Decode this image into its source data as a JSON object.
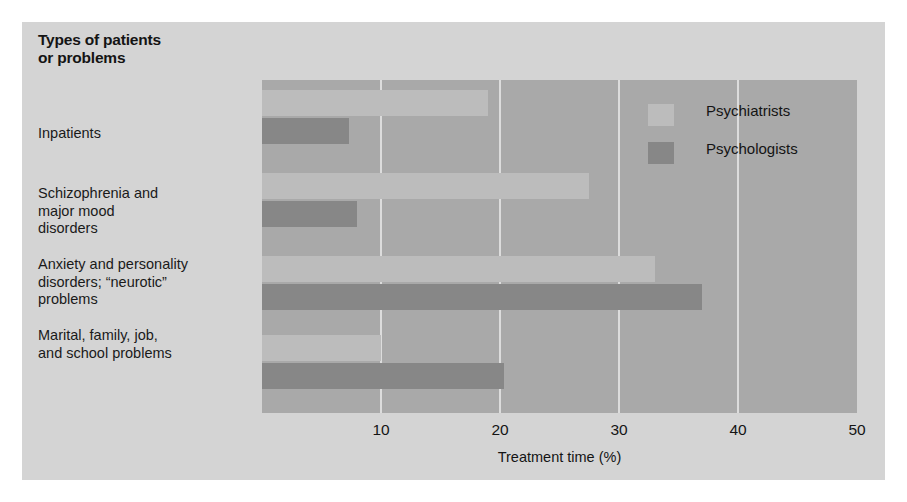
{
  "chart_data": {
    "type": "bar",
    "orientation": "horizontal",
    "xlabel": "Treatment time (%)",
    "ylabel": "",
    "xlim": [
      0,
      50
    ],
    "xticks": [
      0,
      10,
      20,
      30,
      40,
      50
    ],
    "xtick_labels": [
      "",
      "10",
      "20",
      "30",
      "40",
      "50"
    ],
    "grid": "vertical",
    "legend_position": "inside-top-right",
    "categories": [
      "Inpatients",
      "Schizophrenia and major mood disorders",
      "Anxiety and personality disorders; “neurotic” problems",
      "Marital, family, job, and school problems"
    ],
    "category_labels_multiline": [
      [
        "Inpatients"
      ],
      [
        "Schizophrenia and",
        "major mood",
        "disorders"
      ],
      [
        "Anxiety and personality",
        "disorders; “neurotic”",
        "problems"
      ],
      [
        "Marital, family, job,",
        "and school problems"
      ]
    ],
    "series": [
      {
        "name": "Psychiatrists",
        "color": "#bcbcbc",
        "values": [
          19,
          27.5,
          33,
          10
        ]
      },
      {
        "name": "Psychologists",
        "color": "#878787",
        "values": [
          7.3,
          8,
          37,
          20.3
        ]
      }
    ],
    "plot_background": "#a9a9a9",
    "figure_background": "#d4d4d4",
    "gridline_color": "#dcdcdc"
  },
  "legend": {
    "items": [
      {
        "label": "Psychiatrists",
        "color": "#bcbcbc"
      },
      {
        "label": "Psychologists",
        "color": "#878787"
      }
    ]
  },
  "axis": {
    "xlabel": "Treatment time (%)",
    "ticks": [
      "10",
      "20",
      "30",
      "40",
      "50"
    ]
  }
}
